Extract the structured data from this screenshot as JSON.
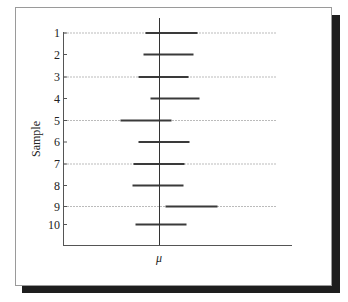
{
  "chart_data": {
    "type": "interval",
    "title": "",
    "ylabel": "Sample",
    "xlabel": "μ",
    "x_marker_label": "μ",
    "categories": [
      "1",
      "2",
      "3",
      "4",
      "5",
      "6",
      "7",
      "8",
      "9",
      "10"
    ],
    "intervals": [
      {
        "sample": "1",
        "lower": -14,
        "upper": 38
      },
      {
        "sample": "2",
        "lower": -16,
        "upper": 34
      },
      {
        "sample": "3",
        "lower": -21,
        "upper": 29
      },
      {
        "sample": "4",
        "lower": -9,
        "upper": 40
      },
      {
        "sample": "5",
        "lower": -39,
        "upper": 12
      },
      {
        "sample": "6",
        "lower": -21,
        "upper": 30
      },
      {
        "sample": "7",
        "lower": -26,
        "upper": 25
      },
      {
        "sample": "8",
        "lower": -27,
        "upper": 24
      },
      {
        "sample": "9",
        "lower": 6,
        "upper": 58
      },
      {
        "sample": "10",
        "lower": -24,
        "upper": 27
      }
    ],
    "interval_units": "pixels relative to μ line",
    "dashed_gridlines_on_samples": [
      "1",
      "3",
      "5",
      "7",
      "9"
    ],
    "grid": "dashed horizontal on odd samples",
    "legend": "none"
  },
  "colors": {
    "bar": "#3a3a3a",
    "axis": "#555555",
    "grid": "#bbbbbb",
    "shadow": "#1e1e1e"
  },
  "labels": {
    "y_title": "Sample",
    "x_mu": "μ"
  }
}
